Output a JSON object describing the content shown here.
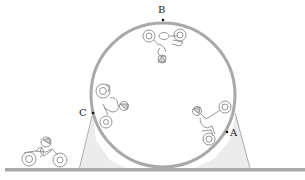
{
  "diagram": {
    "colors": {
      "track": "#a9a9a9",
      "ramp_fill": "#ececec",
      "ramp_edge": "#9a9a9a",
      "rider": "#8a8a8a",
      "point": "#111111"
    },
    "points": [
      {
        "id": "A",
        "label": "A",
        "position": "right side of loop, lower"
      },
      {
        "id": "B",
        "label": "B",
        "position": "top of loop"
      },
      {
        "id": "C",
        "label": "C",
        "position": "left side of loop, middle"
      }
    ],
    "riders": [
      {
        "location": "ground, approaching loop"
      },
      {
        "location": "left side near C"
      },
      {
        "location": "top near B, upside down"
      },
      {
        "location": "right side near A"
      }
    ]
  }
}
